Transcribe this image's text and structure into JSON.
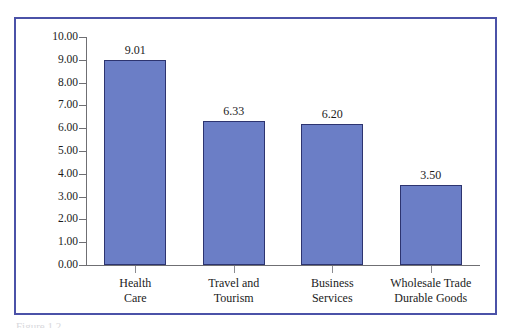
{
  "figure": {
    "frame_color": "#4b52a8",
    "caption": "Figure 1.2"
  },
  "chart_data": {
    "type": "bar",
    "title": "",
    "subtitle": "",
    "xlabel": "",
    "ylabel": "",
    "categories": [
      "Health\nCare",
      "Travel and\nTourism",
      "Business\nServices",
      "Wholesale Trade\nDurable Goods"
    ],
    "category_lines": [
      [
        "Health",
        "Care"
      ],
      [
        "Travel and",
        "Tourism"
      ],
      [
        "Business",
        "Services"
      ],
      [
        "Wholesale Trade",
        "Durable Goods"
      ]
    ],
    "values": [
      9.01,
      6.33,
      6.2,
      3.5
    ],
    "value_labels": [
      "9.01",
      "6.33",
      "6.20",
      "3.50"
    ],
    "ylim": [
      0,
      10
    ],
    "ytick_step": 1,
    "ytick_labels": [
      "10.00",
      "9.00",
      "8.00",
      "7.00",
      "6.00",
      "5.00",
      "4.00",
      "3.00",
      "2.00",
      "1.00",
      "0.00"
    ],
    "ytick_values": [
      10,
      9,
      8,
      7,
      6,
      5,
      4,
      3,
      2,
      1,
      0
    ],
    "grid": false,
    "legend": false,
    "legend_position": "none",
    "bar_color": "#6b7ec6",
    "bar_edge_color": "#2d3470",
    "axis_color": "#6f6f73"
  }
}
